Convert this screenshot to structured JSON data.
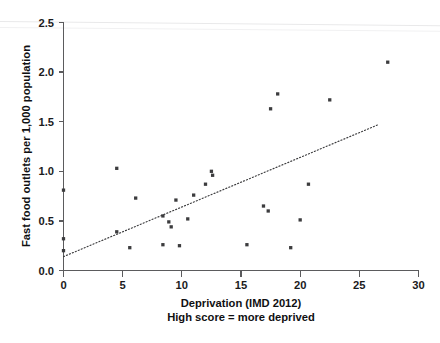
{
  "chart_data": {
    "type": "scatter",
    "title": "",
    "xlabel": "Deprivation (IMD 2012)",
    "xlabel_line2": "High score = more deprived",
    "ylabel": "Fast food outlets per 1,000 population",
    "xlim": [
      0,
      30
    ],
    "ylim": [
      0.0,
      2.5
    ],
    "xticks": [
      0,
      5,
      10,
      15,
      20,
      25,
      30
    ],
    "xtick_labels": [
      "0",
      "5",
      "10",
      "15",
      "20",
      "25",
      "30"
    ],
    "yticks": [
      0.0,
      0.5,
      1.0,
      1.5,
      2.0,
      2.5
    ],
    "ytick_labels": [
      "0.0",
      "0.5",
      "1.0",
      "1.5",
      "2.0",
      "2.5"
    ],
    "grid": false,
    "legend": null,
    "marker_color": "#3c3c3e",
    "marker_shape": "square",
    "points": [
      {
        "x": 0.0,
        "y": 0.81
      },
      {
        "x": 0.0,
        "y": 0.32
      },
      {
        "x": 0.0,
        "y": 0.2
      },
      {
        "x": 4.5,
        "y": 1.03
      },
      {
        "x": 4.5,
        "y": 0.39
      },
      {
        "x": 5.6,
        "y": 0.23
      },
      {
        "x": 6.1,
        "y": 0.73
      },
      {
        "x": 8.4,
        "y": 0.55
      },
      {
        "x": 8.4,
        "y": 0.26
      },
      {
        "x": 8.9,
        "y": 0.49
      },
      {
        "x": 9.1,
        "y": 0.44
      },
      {
        "x": 9.5,
        "y": 0.71
      },
      {
        "x": 9.8,
        "y": 0.25
      },
      {
        "x": 10.5,
        "y": 0.52
      },
      {
        "x": 11.0,
        "y": 0.76
      },
      {
        "x": 12.0,
        "y": 0.87
      },
      {
        "x": 12.5,
        "y": 1.0
      },
      {
        "x": 12.6,
        "y": 0.96
      },
      {
        "x": 15.5,
        "y": 0.26
      },
      {
        "x": 16.9,
        "y": 0.65
      },
      {
        "x": 17.3,
        "y": 0.6
      },
      {
        "x": 17.5,
        "y": 1.63
      },
      {
        "x": 18.1,
        "y": 1.78
      },
      {
        "x": 19.2,
        "y": 0.23
      },
      {
        "x": 20.0,
        "y": 0.51
      },
      {
        "x": 20.7,
        "y": 0.87
      },
      {
        "x": 22.5,
        "y": 1.72
      },
      {
        "x": 27.4,
        "y": 2.1
      }
    ],
    "trend_line": {
      "x1": 0.0,
      "y1": 0.14,
      "x2": 26.6,
      "y2": 1.47,
      "style": "dotted",
      "color": "#3a3a3c"
    }
  }
}
